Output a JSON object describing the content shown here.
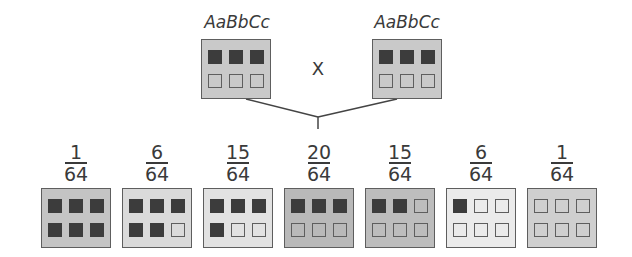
{
  "parents": [
    {
      "genotype": "AaBbCc",
      "alleles": [
        "dark",
        "dark",
        "dark",
        "light",
        "light",
        "light"
      ],
      "background": "#c9c9c9"
    },
    {
      "genotype": "AaBbCc",
      "alleles": [
        "dark",
        "dark",
        "dark",
        "light",
        "light",
        "light"
      ],
      "background": "#c9c9c9"
    }
  ],
  "cross_symbol": "X",
  "offspring": [
    {
      "numerator": "1",
      "denominator": "64",
      "dark_count": 6,
      "alleles": [
        "dark",
        "dark",
        "dark",
        "dark",
        "dark",
        "dark"
      ],
      "background": "#c4c4c4"
    },
    {
      "numerator": "6",
      "denominator": "64",
      "dark_count": 5,
      "alleles": [
        "dark",
        "dark",
        "dark",
        "dark",
        "dark",
        "light"
      ],
      "background": "#dadada"
    },
    {
      "numerator": "15",
      "denominator": "64",
      "dark_count": 4,
      "alleles": [
        "dark",
        "dark",
        "dark",
        "dark",
        "light",
        "light"
      ],
      "background": "#e2e2e2"
    },
    {
      "numerator": "20",
      "denominator": "64",
      "dark_count": 3,
      "alleles": [
        "dark",
        "dark",
        "dark",
        "light",
        "light",
        "light"
      ],
      "background": "#b9b9b9"
    },
    {
      "numerator": "15",
      "denominator": "64",
      "dark_count": 2,
      "alleles": [
        "dark",
        "dark",
        "light",
        "light",
        "light",
        "light"
      ],
      "background": "#bdbdbd"
    },
    {
      "numerator": "6",
      "denominator": "64",
      "dark_count": 1,
      "alleles": [
        "dark",
        "light",
        "light",
        "light",
        "light",
        "light"
      ],
      "background": "#ebebeb"
    },
    {
      "numerator": "1",
      "denominator": "64",
      "dark_count": 0,
      "alleles": [
        "light",
        "light",
        "light",
        "light",
        "light",
        "light"
      ],
      "background": "#cfcfcf"
    }
  ]
}
